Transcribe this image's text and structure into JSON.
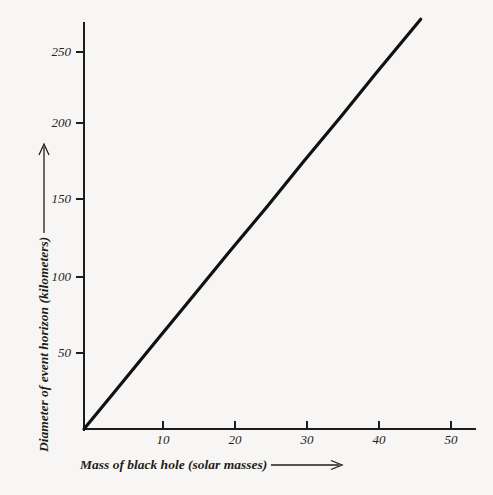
{
  "chart_data": {
    "type": "line",
    "title": "",
    "subtitle": "",
    "xlabel": "Mass of black hole (solar masses)",
    "ylabel": "Diameter of event horizon (kilometers)",
    "xlim": [
      0,
      54
    ],
    "ylim": [
      0,
      266
    ],
    "xticks": [
      10,
      20,
      30,
      40,
      50
    ],
    "yticks": [
      50,
      100,
      150,
      200,
      250
    ],
    "xtick_labels": [
      "10",
      "20",
      "30",
      "40",
      "50"
    ],
    "ytick_labels": [
      "50",
      "100",
      "150",
      "200",
      "250"
    ],
    "grid": false,
    "legend": null,
    "series": [
      {
        "name": "Schwarzschild diameter",
        "x": [
          0,
          5,
          10,
          15,
          20,
          25,
          30,
          35,
          40,
          46
        ],
        "values": [
          0,
          29.5,
          59,
          88.5,
          118,
          147,
          177,
          206,
          236,
          271
        ],
        "color": "#111111",
        "linewidth": 3.2
      }
    ],
    "annotations": []
  },
  "axes": {
    "x_title": "Mass of black hole (solar masses)",
    "y_title": "Diameter of event horizon (kilometers)",
    "x_arrow_icon": "arrow-right-icon",
    "y_arrow_icon": "arrow-up-icon"
  },
  "style": {
    "background": "#f7f6f4",
    "axis_color": "#1c1c1c",
    "line_color": "#111111",
    "text_color": "#1f1d1a"
  }
}
